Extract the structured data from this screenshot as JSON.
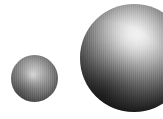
{
  "scene": {
    "title": "Shaded Spheres",
    "width": 163,
    "height": 119,
    "background_color": "#ffffff",
    "object_count": 2,
    "rendering_style": "grayscale shaded spheres with specular highlight and dark rim"
  },
  "objects": [
    {
      "name": "small-sphere",
      "label": "Small sphere",
      "shape": "sphere",
      "center_x": 34,
      "center_y": 78,
      "diameter": 47,
      "highlight_x": 32,
      "highlight_y": 75,
      "highlight_color": "#f2f2f2",
      "midtone_color": "#8a8a8a",
      "rim_color": "#000000",
      "clipped": "false"
    },
    {
      "name": "large-sphere",
      "label": "Large sphere",
      "shape": "sphere",
      "center_x": 134,
      "center_y": 58,
      "diameter": 108,
      "highlight_x": 132,
      "highlight_y": 42,
      "highlight_color": "#ffffff",
      "midtone_color": "#7b7b7b",
      "rim_color": "#000000",
      "clipped": "true"
    }
  ]
}
